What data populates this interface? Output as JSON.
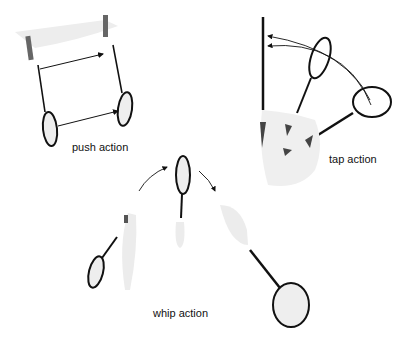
{
  "diagram": {
    "labels": {
      "push": "push action",
      "tap": "tap action",
      "whip": "whip action"
    },
    "colors": {
      "line": "#111111",
      "racket_face": "#eeeeee",
      "hand": "#e8e8e8",
      "grip": "#555555",
      "background": "#ffffff"
    }
  }
}
